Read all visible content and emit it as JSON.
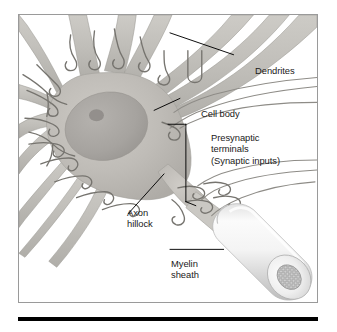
{
  "figure": {
    "type": "anatomical-diagram",
    "style": "grayscale pencil-shaded illustration",
    "frame": {
      "border_color": "#9a9a9a",
      "background": "#ffffff"
    },
    "rule": {
      "color": "#000000"
    }
  },
  "labels": {
    "dendrites": "Dendrites",
    "cell_body": "Cell body",
    "presynaptic_line1": "Presynaptic",
    "presynaptic_line2": "terminals",
    "presynaptic_line3": "(Synaptic inputs)",
    "axon_hillock_line1": "Axon",
    "axon_hillock_line2": "hillock",
    "myelin_line1": "Myelin",
    "myelin_line2": "sheath"
  },
  "colors": {
    "text": "#1a1a1a",
    "leader_line": "#000000",
    "frame_border": "#9a9a9a",
    "soma_fill": "#b9b7b2",
    "soma_fill_light": "#c9c7c2",
    "nucleus_fill": "#a8a6a2",
    "nucleolus_fill": "#8e8c88",
    "dendrite_fill": "#c2c0bb",
    "axon_terminal_stroke": "#6e6c68",
    "myelin_light": "#f2f2f2",
    "myelin_mid": "#d8d8d8",
    "myelin_shadow": "#bcbcbc",
    "axon_core": "#cfcfcf",
    "rule": "#000000"
  },
  "parts": [
    {
      "name": "dendrites",
      "description": "broad tapering processes radiating from the soma"
    },
    {
      "name": "cell-body",
      "description": "soma containing nucleus and nucleolus"
    },
    {
      "name": "nucleus",
      "description": "large oval within soma"
    },
    {
      "name": "nucleolus",
      "description": "small dark spot within nucleus"
    },
    {
      "name": "presynaptic-terminals",
      "description": "small looped boutons contacting the soma and dendrites"
    },
    {
      "name": "axon-hillock",
      "description": "tapering junction between soma and axon"
    },
    {
      "name": "myelin-sheath",
      "description": "cylindrical sleeve around the axon with cut end face"
    },
    {
      "name": "axon-cross-section",
      "description": "textured core visible at cut end of the myelin cylinder"
    }
  ]
}
